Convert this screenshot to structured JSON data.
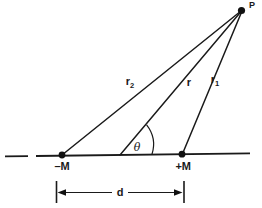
{
  "figure": {
    "type": "geometry-diagram",
    "background_color": "#ffffff",
    "ink_color": "#1a1a1a"
  },
  "labels": {
    "ray_far": "r",
    "ray_far_sub": "2",
    "ray_mid": "r",
    "ray_near": "r",
    "ray_near_sub": "1",
    "pole_negative": "–M",
    "pole_positive": "+M",
    "angle": "θ",
    "separation": "d",
    "field_point": "P"
  },
  "geometry": {
    "axis_line": {
      "y": 155,
      "x_start": 5,
      "x_end": 250,
      "gap_start": 28,
      "gap_end": 36
    },
    "poles": [
      {
        "name": "pole-negative",
        "label": "–M",
        "x": 62,
        "y": 155,
        "dot_radius": 3.2
      },
      {
        "name": "pole-positive",
        "label": "+M",
        "x": 182,
        "y": 155,
        "dot_radius": 3.2
      }
    ],
    "center": {
      "x": 120,
      "y": 155
    },
    "field_point": {
      "x": 242,
      "y": 10,
      "dot_radius": 3.4
    },
    "rays": [
      {
        "name": "r2",
        "from_x": 62,
        "from_y": 155,
        "to_x": 242,
        "to_y": 10,
        "label_x": 132,
        "label_y": 82
      },
      {
        "name": "r",
        "from_x": 120,
        "from_y": 155,
        "to_x": 242,
        "to_y": 10,
        "label_x": 188,
        "label_y": 85
      },
      {
        "name": "r1",
        "from_x": 182,
        "from_y": 155,
        "to_x": 242,
        "to_y": 10,
        "label_x": 216,
        "label_y": 82
      }
    ],
    "angle_arc": {
      "center_x": 120,
      "center_y": 155,
      "radius": 32,
      "start_x": 152,
      "start_y": 155,
      "end_x": 146.6,
      "end_y": 124.9,
      "label_x": 136,
      "label_y": 150
    },
    "dimension": {
      "y": 192,
      "x_start": 56,
      "x_end": 184,
      "tick_top": 182,
      "tick_bottom": 202,
      "label_x": 120,
      "label_y": 196,
      "text_gap_left": 113,
      "text_gap_right": 127
    }
  }
}
